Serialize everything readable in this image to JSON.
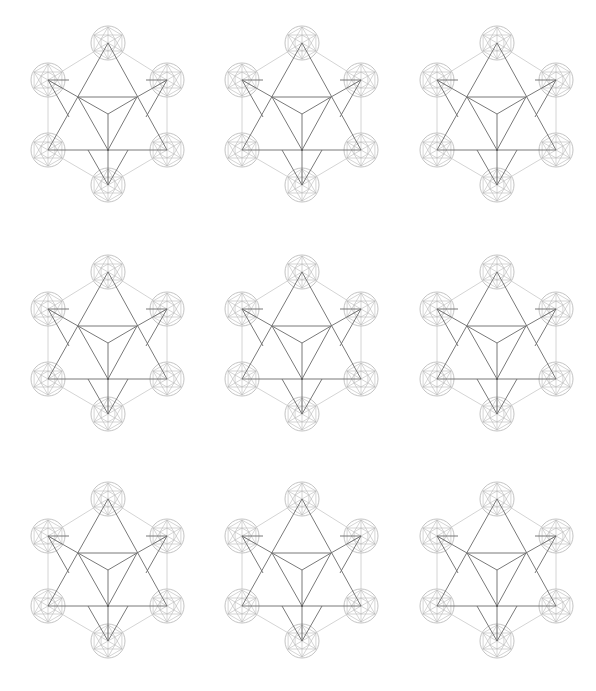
{
  "figure": {
    "name": "Metatron cube star tetrahedron",
    "count": 9,
    "grid": {
      "columns": 3,
      "rows": 3
    },
    "colors": {
      "background": "#ffffff",
      "outer_hexagon": "#cfcfcf",
      "star_lines": "#6a6a6a",
      "circles": "#b4b4b4"
    },
    "circle_radius": 17,
    "nodes": {
      "top": [
        0,
        0
      ],
      "upper_left": [
        -60,
        37
      ],
      "upper_right": [
        59,
        37
      ],
      "lower_left": [
        -60,
        107
      ],
      "lower_right": [
        59,
        107
      ],
      "bottom": [
        0,
        142
      ],
      "inner_left": [
        -30,
        54
      ],
      "inner_right": [
        29,
        54
      ],
      "inner_center": [
        0,
        71
      ],
      "base_center": [
        0,
        107
      ]
    }
  },
  "instances": [
    {
      "id": "r1c1",
      "x": 108,
      "y": 43
    },
    {
      "id": "r1c2",
      "x": 302,
      "y": 43
    },
    {
      "id": "r1c3",
      "x": 497,
      "y": 43
    },
    {
      "id": "r2c1",
      "x": 108,
      "y": 272
    },
    {
      "id": "r2c2",
      "x": 302,
      "y": 272
    },
    {
      "id": "r2c3",
      "x": 497,
      "y": 272
    },
    {
      "id": "r3c1",
      "x": 108,
      "y": 499
    },
    {
      "id": "r3c2",
      "x": 302,
      "y": 499
    },
    {
      "id": "r3c3",
      "x": 497,
      "y": 499
    }
  ]
}
